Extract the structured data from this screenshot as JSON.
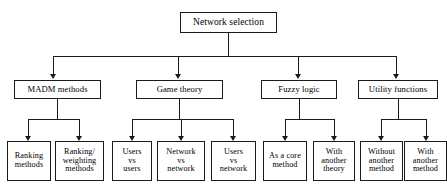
{
  "diagram": {
    "type": "tree",
    "title": "Network selection",
    "orientation": "top-down",
    "line_color": "#1a1a1a",
    "box_fill": "#ffffff",
    "root": {
      "label": "Network selection"
    },
    "level2": [
      {
        "label": "MADM methods"
      },
      {
        "label": "Game theory"
      },
      {
        "label": "Fuzzy logic"
      },
      {
        "label": "Utility functions"
      }
    ],
    "level3": [
      {
        "label": "Ranking\nmethods",
        "parent": "MADM methods"
      },
      {
        "label": "Ranking/\nweighting\nmethods",
        "parent": "MADM methods"
      },
      {
        "label": "Users\nvs\nusers",
        "parent": "Game theory"
      },
      {
        "label": "Network\nvs\nnetwork",
        "parent": "Game theory"
      },
      {
        "label": "Users\nvs\nnetwork",
        "parent": "Game theory"
      },
      {
        "label": "As a core\nmethod",
        "parent": "Fuzzy logic"
      },
      {
        "label": "With\nanother\ntheory",
        "parent": "Fuzzy logic"
      },
      {
        "label": "Without\nanother\nmethod",
        "parent": "Utility functions"
      },
      {
        "label": "With\nanother\nmethod",
        "parent": "Utility functions"
      }
    ]
  }
}
